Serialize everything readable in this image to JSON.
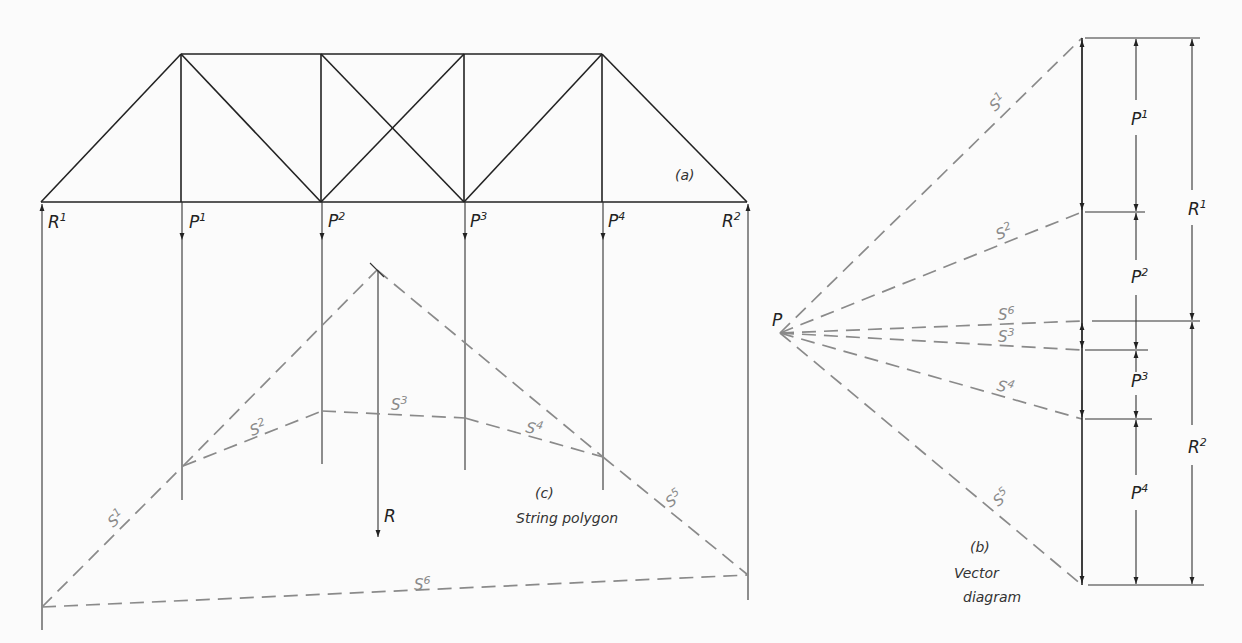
{
  "figure": {
    "truss_panel_label": "(a)",
    "vector_panel_label": "(b)",
    "vector_panel_caption_1": "Vector",
    "vector_panel_caption_2": "diagram",
    "string_panel_label": "(c)",
    "string_panel_caption": "String polygon"
  },
  "truss": {
    "reactions": [
      {
        "base": "R",
        "sup": "1"
      },
      {
        "base": "R",
        "sup": "2"
      }
    ],
    "loads": [
      {
        "base": "P",
        "sup": "1"
      },
      {
        "base": "P",
        "sup": "2"
      },
      {
        "base": "P",
        "sup": "3"
      },
      {
        "base": "P",
        "sup": "4"
      }
    ],
    "resultant": {
      "base": "R"
    }
  },
  "string_polygon": {
    "segments": [
      {
        "base": "S",
        "sup": "1"
      },
      {
        "base": "S",
        "sup": "2"
      },
      {
        "base": "S",
        "sup": "3"
      },
      {
        "base": "S",
        "sup": "4"
      },
      {
        "base": "S",
        "sup": "5"
      },
      {
        "base": "S",
        "sup": "6"
      }
    ]
  },
  "vector_diagram": {
    "pole": "P",
    "rays": [
      {
        "base": "S",
        "sup": "1"
      },
      {
        "base": "S",
        "sup": "2"
      },
      {
        "base": "S",
        "sup": "6"
      },
      {
        "base": "S",
        "sup": "3"
      },
      {
        "base": "S",
        "sup": "4"
      },
      {
        "base": "S",
        "sup": "5"
      }
    ],
    "load_dims": [
      {
        "base": "P",
        "sup": "1"
      },
      {
        "base": "P",
        "sup": "2"
      },
      {
        "base": "P",
        "sup": "3"
      },
      {
        "base": "P",
        "sup": "4"
      }
    ],
    "reaction_dims": [
      {
        "base": "R",
        "sup": "1"
      },
      {
        "base": "R",
        "sup": "2"
      }
    ]
  }
}
